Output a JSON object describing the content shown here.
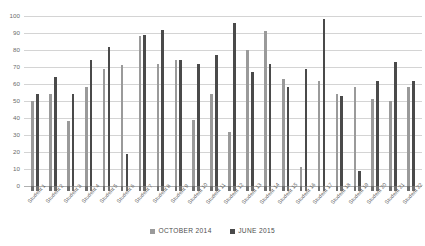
{
  "chart_data": {
    "type": "bar",
    "title": "",
    "subtitle": "",
    "xlabel": "",
    "ylabel": "",
    "ylim": [
      0,
      100
    ],
    "ytick_step": 10,
    "yticks": [
      "100",
      "90",
      "80",
      "70",
      "60",
      "50",
      "40",
      "30",
      "20",
      "10",
      "0"
    ],
    "grid": true,
    "legend_position": "bottom-center",
    "categories": [
      "Student 1",
      "Student 2",
      "Student 3",
      "Student 4",
      "Student 5",
      "Student 6",
      "Student 7",
      "Student 8",
      "Student 9",
      "Student 10",
      "Student 11",
      "Student 12",
      "Student 13",
      "Student 14",
      "Student 15",
      "Student 16",
      "Student 17",
      "Student 18",
      "Student 19",
      "Student 20",
      "Student 21",
      "Student 22"
    ],
    "series": [
      {
        "name": "October 2014",
        "color": "#9a9a9a",
        "values": [
          50,
          54,
          38,
          58,
          69,
          71,
          88,
          72,
          74,
          39,
          54,
          32,
          80,
          91,
          63,
          11,
          62,
          54,
          58,
          51,
          50,
          58
        ]
      },
      {
        "name": "June 2015",
        "color": "#4a4a4a",
        "values": [
          54,
          64,
          54,
          74,
          82,
          19,
          89,
          92,
          74,
          72,
          77,
          96,
          67,
          72,
          58,
          69,
          98,
          53,
          9,
          62,
          73,
          62
        ]
      }
    ]
  },
  "legend": {
    "items": [
      {
        "label": "October 2014",
        "color": "#9a9a9a"
      },
      {
        "label": "June 2015",
        "color": "#4a4a4a"
      }
    ]
  },
  "colors": {
    "october": "#9a9a9a",
    "june": "#4a4a4a",
    "gridline": "#d4d4d4",
    "axis_text": "#6b6b6b",
    "background": "#ffffff"
  }
}
